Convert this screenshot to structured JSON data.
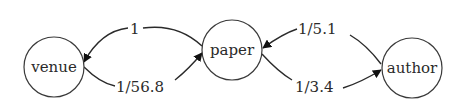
{
  "diagram": {
    "nodes": [
      {
        "id": "venue",
        "label": "venue"
      },
      {
        "id": "paper",
        "label": "paper"
      },
      {
        "id": "author",
        "label": "author"
      }
    ],
    "edges": [
      {
        "from": "paper",
        "to": "venue",
        "label": "1"
      },
      {
        "from": "venue",
        "to": "paper",
        "label": "1/56.8"
      },
      {
        "from": "author",
        "to": "paper",
        "label": "1/5.1"
      },
      {
        "from": "paper",
        "to": "author",
        "label": "1/3.4"
      }
    ]
  }
}
